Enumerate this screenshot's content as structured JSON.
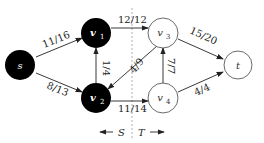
{
  "diagram": {
    "nodes": [
      {
        "id": "s",
        "label": "s",
        "x": 20,
        "y": 65,
        "filled": true
      },
      {
        "id": "v1",
        "label": "v",
        "sub": "1",
        "x": 96,
        "y": 33,
        "filled": true
      },
      {
        "id": "v2",
        "label": "v",
        "sub": "2",
        "x": 96,
        "y": 98,
        "filled": true
      },
      {
        "id": "v3",
        "label": "v",
        "sub": "3",
        "x": 163,
        "y": 33,
        "filled": false
      },
      {
        "id": "v4",
        "label": "v",
        "sub": "4",
        "x": 163,
        "y": 98,
        "filled": false
      },
      {
        "id": "t",
        "label": "t",
        "x": 238,
        "y": 65,
        "filled": false
      }
    ],
    "edges": [
      {
        "from": "s",
        "to": "v1",
        "label": "11/16"
      },
      {
        "from": "s",
        "to": "v2",
        "label": "8/13"
      },
      {
        "from": "v2",
        "to": "v1",
        "label": "1/4"
      },
      {
        "from": "v1",
        "to": "v3",
        "label": "12/12"
      },
      {
        "from": "v3",
        "to": "v2",
        "label": "4/9"
      },
      {
        "from": "v2",
        "to": "v4",
        "label": "11/14"
      },
      {
        "from": "v4",
        "to": "v3",
        "label": "7/7"
      },
      {
        "from": "v3",
        "to": "t",
        "label": "15/20"
      },
      {
        "from": "v4",
        "to": "t",
        "label": "4/4"
      }
    ],
    "cut": {
      "left_label": "S",
      "right_label": "T"
    }
  }
}
